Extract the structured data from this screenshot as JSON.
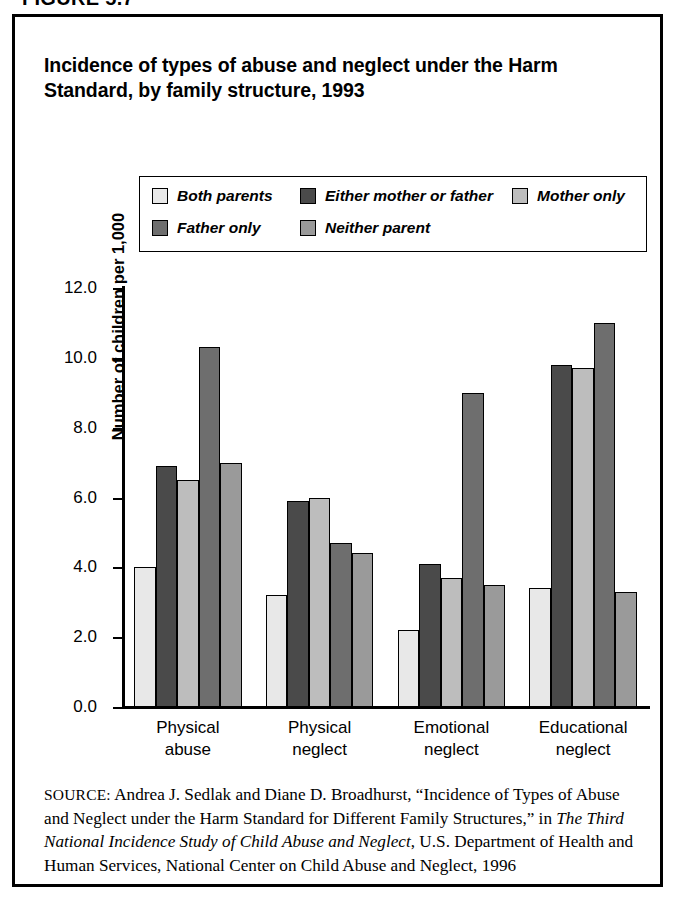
{
  "figure": {
    "label": "FIGURE 5.7"
  },
  "title": "Incidence of types of abuse and neglect under the Harm Standard, by family structure, 1993",
  "legend": {
    "position": "top-inside",
    "entries": [
      {
        "label": "Both parents",
        "color": "#e8e8e8"
      },
      {
        "label": "Either mother or father",
        "color": "#4a4a4a"
      },
      {
        "label": "Mother only",
        "color": "#bdbdbd"
      },
      {
        "label": "Father only",
        "color": "#6e6e6e"
      },
      {
        "label": "Neither parent",
        "color": "#9a9a9a"
      }
    ]
  },
  "axes": {
    "y_title": "Number of children per 1,000",
    "y_ticks": [
      "12.0",
      "10.0",
      "8.0",
      "6.0",
      "4.0",
      "2.0",
      "0.0"
    ],
    "y_tick_values": [
      12.0,
      10.0,
      8.0,
      6.0,
      4.0,
      2.0,
      0.0
    ],
    "grid": false
  },
  "source": {
    "kicker": "SOURCE:",
    "text_1": " Andrea J. Sedlak and Diane D. Broadhurst, “Incidence of Types of Abuse and Neglect under the Harm Standard for Different Family Structures,” in ",
    "italic_1": "The Third National Incidence Study of Child Abuse and Neglect",
    "text_2": ", U.S. Department of Health and Human Services, National Center on Child Abuse and Neglect, 1996"
  },
  "chart_data": {
    "type": "bar",
    "title": "Incidence of types of abuse and neglect under the Harm Standard, by family structure, 1993",
    "xlabel": "",
    "ylabel": "Number of children per 1,000",
    "ylim": [
      0.0,
      12.0
    ],
    "ytick_step": 2.0,
    "grid": false,
    "legend_position": "top-inside",
    "categories": [
      "Physical abuse",
      "Physical neglect",
      "Emotional neglect",
      "Educational neglect"
    ],
    "category_lines": [
      [
        "Physical",
        "abuse"
      ],
      [
        "Physical",
        "neglect"
      ],
      [
        "Emotional",
        "neglect"
      ],
      [
        "Educational",
        "neglect"
      ]
    ],
    "series": [
      {
        "name": "Both parents",
        "color": "#e8e8e8",
        "values": [
          4.0,
          3.2,
          2.2,
          3.4
        ]
      },
      {
        "name": "Either mother or father",
        "color": "#4a4a4a",
        "values": [
          6.9,
          5.9,
          4.1,
          9.8
        ]
      },
      {
        "name": "Mother only",
        "color": "#bdbdbd",
        "values": [
          6.5,
          6.0,
          3.7,
          9.7
        ]
      },
      {
        "name": "Father only",
        "color": "#6e6e6e",
        "values": [
          10.3,
          4.7,
          9.0,
          11.0
        ]
      },
      {
        "name": "Neither parent",
        "color": "#9a9a9a",
        "values": [
          7.0,
          4.4,
          3.5,
          3.3
        ]
      }
    ]
  }
}
